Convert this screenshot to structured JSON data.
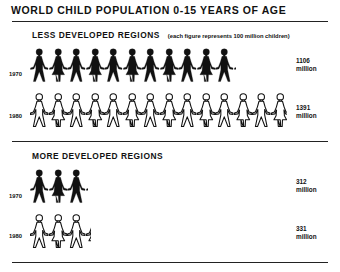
{
  "title": "WORLD CHILD POPULATION 0-15 YEARS OF AGE",
  "sections": [
    {
      "title": "LESS DEVELOPED REGIONS",
      "note": "(each figure represents 100 million children)",
      "rows": [
        {
          "year": "1970",
          "value": "1106",
          "unit": "million",
          "style": "filled"
        },
        {
          "year": "1980",
          "value": "1391",
          "unit": "million",
          "style": "outline"
        }
      ]
    },
    {
      "title": "MORE DEVELOPED REGIONS",
      "rows": [
        {
          "year": "1970",
          "value": "312",
          "unit": "million",
          "style": "filled"
        },
        {
          "year": "1980",
          "value": "331",
          "unit": "million",
          "style": "outline"
        }
      ]
    }
  ],
  "chart_data": {
    "type": "pictogram",
    "title": "WORLD CHILD POPULATION 0-15 YEARS OF AGE",
    "unit_note": "each figure represents 100 million children",
    "categories": [
      "1970",
      "1980"
    ],
    "series": [
      {
        "name": "LESS DEVELOPED REGIONS",
        "values": [
          1106,
          1391
        ],
        "unit": "million"
      },
      {
        "name": "MORE DEVELOPED REGIONS",
        "values": [
          312,
          331
        ],
        "unit": "million"
      }
    ],
    "figure_value": 100,
    "colors": {
      "1970": "#111111",
      "1980": "outline"
    }
  }
}
